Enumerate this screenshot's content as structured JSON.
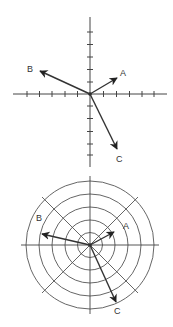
{
  "diagrams": [
    {
      "type": "cartesian",
      "title": "Vectors on Cartesian axes",
      "origin": [
        90,
        94
      ],
      "vectors": [
        {
          "label": "A",
          "tip": [
            117,
            78
          ],
          "label_pos": [
            123,
            76
          ]
        },
        {
          "label": "B",
          "tip": [
            40,
            71
          ],
          "label_pos": [
            27,
            72
          ]
        },
        {
          "label": "C",
          "tip": [
            117,
            149
          ],
          "label_pos": [
            117,
            162
          ]
        }
      ],
      "ticks_per_side": 5
    },
    {
      "type": "polar",
      "title": "Vectors on polar grid",
      "origin": [
        90,
        245
      ],
      "rings": 5,
      "vectors": [
        {
          "label": "A",
          "tip": [
            114,
            232
          ],
          "label_pos": [
            123,
            229
          ]
        },
        {
          "label": "B",
          "tip": [
            42,
            234
          ],
          "label_pos": [
            36,
            221
          ]
        },
        {
          "label": "C",
          "tip": [
            116,
            302
          ],
          "label_pos": [
            116,
            313
          ]
        }
      ]
    }
  ],
  "colors": {
    "line": "#333333",
    "grid": "#444444",
    "background": "#ffffff"
  }
}
